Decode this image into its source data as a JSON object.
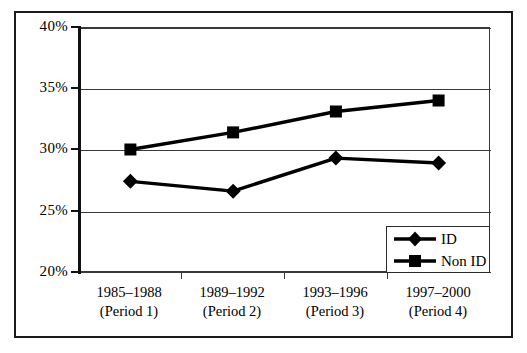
{
  "chart_data": {
    "type": "line",
    "title": "",
    "subtitle": "",
    "xlabel": "",
    "ylabel": "",
    "categories": [
      "1985–1988\n(Period 1)",
      "1989–1992\n(Period 2)",
      "1993–1996\n(Period 3)",
      "1997–2000\n(Period 4)"
    ],
    "category_lines": [
      {
        "line1": "1985–1988",
        "line2": "(Period 1)"
      },
      {
        "line1": "1989–1992",
        "line2": "(Period 2)"
      },
      {
        "line1": "1993–1996",
        "line2": "(Period 3)"
      },
      {
        "line1": "1997–2000",
        "line2": "(Period 4)"
      }
    ],
    "series": [
      {
        "name": "ID",
        "marker": "diamond",
        "values": [
          27.4,
          26.6,
          29.3,
          28.9
        ]
      },
      {
        "name": "Non ID",
        "marker": "square",
        "values": [
          30.0,
          31.4,
          33.1,
          34.0
        ]
      }
    ],
    "ylim": [
      20,
      40
    ],
    "ytick_values": [
      40,
      35,
      30,
      25,
      20
    ],
    "ytick_labels": [
      "40%",
      "35%",
      "30%",
      "25%",
      "20%"
    ],
    "grid": "horizontal",
    "legend_position": "inside-bottom-right",
    "legend_entries": [
      "ID",
      "Non ID"
    ],
    "colors": {
      "series_line": "#000000",
      "marker_fill": "#000000",
      "grid": "#3a3a3a",
      "axis": "#111111",
      "frame": "#1a1a1a",
      "background": "#ffffff"
    }
  }
}
